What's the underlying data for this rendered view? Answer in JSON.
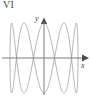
{
  "figure": {
    "label": "VI",
    "caption_text": "VI"
  },
  "axes": {
    "x_label": "x",
    "y_label": "y",
    "origin_px": [
      44,
      58
    ],
    "x_axis_from_px": [
      2,
      58
    ],
    "x_axis_to_px": [
      84,
      58
    ],
    "y_axis_from_px": [
      44,
      95
    ],
    "y_axis_to_px": [
      44,
      21
    ],
    "x_arrow": "right-arrowhead",
    "y_arrow": "up-arrowhead",
    "axis_color": "#7d7d7d"
  },
  "chart_data": {
    "type": "line",
    "title": "VI",
    "xlabel": "x",
    "ylabel": "y",
    "grid": false,
    "legend": null,
    "curve_kind": "lissajous",
    "parametric": {
      "x_expression": "A*sin(a*t + d)",
      "y_expression": "B*sin(b*t)",
      "a": 1,
      "b": 5,
      "delta": 1.5707963,
      "A_px": 34,
      "B_px": 35,
      "t_start": 0,
      "t_end": 6.2831853,
      "samples": 720
    },
    "xlim": [
      -34,
      34
    ],
    "ylim": [
      -35,
      35
    ],
    "stroke_color": "#8a8a8a",
    "stroke_width": 0.65,
    "lobe_count": 5,
    "extent_px": {
      "left": 10,
      "right": 78,
      "top": 24,
      "bottom": 93
    }
  }
}
